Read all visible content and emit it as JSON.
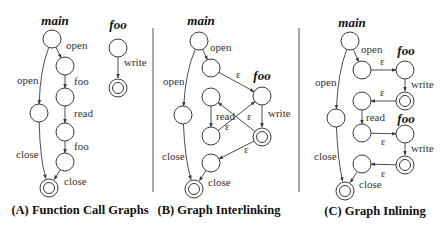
{
  "colors": {
    "stroke": "#3a3a3a",
    "text": "#333333",
    "background": "#ffffff"
  },
  "node_radius": 9,
  "dividers": [
    {
      "x": 153,
      "y1": 28,
      "y2": 192
    },
    {
      "x": 299,
      "y1": 28,
      "y2": 192
    }
  ],
  "panels": [
    {
      "id": "A",
      "caption": "(A) Function Call Graphs",
      "caption_pos": [
        80,
        214
      ],
      "graph_labels": [
        {
          "text": "main",
          "x": 55,
          "y": 25
        },
        {
          "text": "foo",
          "x": 118,
          "y": 29
        }
      ],
      "nodes": [
        {
          "id": "a0",
          "x": 52,
          "y": 39
        },
        {
          "id": "a1",
          "x": 65,
          "y": 66
        },
        {
          "id": "a2",
          "x": 65,
          "y": 97
        },
        {
          "id": "a3",
          "x": 39,
          "y": 113
        },
        {
          "id": "a4",
          "x": 65,
          "y": 132
        },
        {
          "id": "a5",
          "x": 65,
          "y": 162
        },
        {
          "id": "a6",
          "x": 49,
          "y": 188,
          "final": true
        },
        {
          "id": "f0",
          "x": 118,
          "y": 48
        },
        {
          "id": "f1",
          "x": 118,
          "y": 88,
          "final": true
        }
      ],
      "edges": [
        {
          "from": "a0",
          "to": "a1",
          "label": "open",
          "lx": 66,
          "ly": 49
        },
        {
          "from": "a1",
          "to": "a2",
          "label": "foo",
          "lx": 74,
          "ly": 85
        },
        {
          "from": "a2",
          "to": "a4",
          "label": "read",
          "lx": 74,
          "ly": 117
        },
        {
          "from": "a4",
          "to": "a5",
          "label": "foo",
          "lx": 74,
          "ly": 150
        },
        {
          "from": "a5",
          "to": "a6",
          "label": "close",
          "lx": 64,
          "ly": 185
        },
        {
          "from": "a0",
          "to": "a3",
          "label": "open",
          "lx": 17,
          "ly": 84,
          "curve": [
            40,
            70
          ]
        },
        {
          "from": "a3",
          "to": "a6",
          "label": "close",
          "lx": 16,
          "ly": 158,
          "curve": [
            40,
            160
          ]
        },
        {
          "from": "f0",
          "to": "f1",
          "label": "write",
          "lx": 124,
          "ly": 66
        }
      ]
    },
    {
      "id": "B",
      "caption": "(B) Graph Interlinking",
      "caption_pos": [
        219,
        214
      ],
      "graph_labels": [
        {
          "text": "main",
          "x": 201,
          "y": 25
        },
        {
          "text": "foo",
          "x": 262,
          "y": 80
        }
      ],
      "nodes": [
        {
          "id": "b0",
          "x": 199,
          "y": 41
        },
        {
          "id": "b1",
          "x": 211,
          "y": 68
        },
        {
          "id": "b2",
          "x": 211,
          "y": 97
        },
        {
          "id": "b3",
          "x": 183,
          "y": 115
        },
        {
          "id": "b4",
          "x": 211,
          "y": 136
        },
        {
          "id": "b5",
          "x": 211,
          "y": 163
        },
        {
          "id": "b6",
          "x": 194,
          "y": 189,
          "final": true
        },
        {
          "id": "g0",
          "x": 262,
          "y": 96
        },
        {
          "id": "g1",
          "x": 262,
          "y": 137,
          "final": true
        }
      ],
      "edges": [
        {
          "from": "b0",
          "to": "b1",
          "label": "open",
          "lx": 210,
          "ly": 51
        },
        {
          "from": "b1",
          "to": "g0",
          "label": "ε",
          "lx": 236,
          "ly": 78
        },
        {
          "from": "b2",
          "to": "b4",
          "label": "read",
          "lx": 216,
          "ly": 120
        },
        {
          "from": "b4",
          "to": "g0",
          "label": "ε",
          "lx": 225,
          "ly": 130
        },
        {
          "from": "g1",
          "to": "b2",
          "label": "ε",
          "lx": 247,
          "ly": 120
        },
        {
          "from": "g1",
          "to": "b5",
          "label": "ε",
          "lx": 244,
          "ly": 153
        },
        {
          "from": "g0",
          "to": "b6",
          "label": "",
          "skip": true
        },
        {
          "from": "b5",
          "to": "b6",
          "label": "close",
          "lx": 208,
          "ly": 186
        },
        {
          "from": "b0",
          "to": "b3",
          "label": "open",
          "lx": 163,
          "ly": 85,
          "curve": [
            186,
            70
          ]
        },
        {
          "from": "b3",
          "to": "b6",
          "label": "close",
          "lx": 162,
          "ly": 160,
          "curve": [
            185,
            160
          ]
        },
        {
          "from": "g0",
          "to": "g1",
          "label": "write",
          "lx": 268,
          "ly": 117
        }
      ]
    },
    {
      "id": "C",
      "caption": "(C) Graph Inlining",
      "caption_pos": [
        375,
        215
      ],
      "graph_labels": [
        {
          "text": "main",
          "x": 352,
          "y": 27
        },
        {
          "text": "foo",
          "x": 406,
          "y": 55
        },
        {
          "text": "foo",
          "x": 406,
          "y": 123
        }
      ],
      "nodes": [
        {
          "id": "c0",
          "x": 350,
          "y": 41
        },
        {
          "id": "c1",
          "x": 362,
          "y": 70
        },
        {
          "id": "c2",
          "x": 362,
          "y": 101
        },
        {
          "id": "c3",
          "x": 336,
          "y": 118
        },
        {
          "id": "c4",
          "x": 362,
          "y": 133
        },
        {
          "id": "c5",
          "x": 362,
          "y": 164
        },
        {
          "id": "c6",
          "x": 345,
          "y": 191,
          "final": true
        },
        {
          "id": "h0",
          "x": 405,
          "y": 70
        },
        {
          "id": "h1",
          "x": 405,
          "y": 101,
          "final": true
        },
        {
          "id": "k0",
          "x": 405,
          "y": 134
        },
        {
          "id": "k1",
          "x": 405,
          "y": 165,
          "final": true
        }
      ],
      "edges": [
        {
          "from": "c0",
          "to": "c1",
          "label": "open",
          "lx": 361,
          "ly": 53
        },
        {
          "from": "c1",
          "to": "h0",
          "label": "ε",
          "lx": 380,
          "ly": 65
        },
        {
          "from": "h0",
          "to": "h1",
          "label": "write",
          "lx": 411,
          "ly": 88
        },
        {
          "from": "h1",
          "to": "c2",
          "label": "ε",
          "lx": 380,
          "ly": 96
        },
        {
          "from": "c2",
          "to": "c4",
          "label": "read",
          "lx": 366,
          "ly": 121
        },
        {
          "from": "c4",
          "to": "k0",
          "label": "ε",
          "lx": 381,
          "ly": 145
        },
        {
          "from": "k0",
          "to": "k1",
          "label": "write",
          "lx": 411,
          "ly": 152
        },
        {
          "from": "k1",
          "to": "c5",
          "label": "ε",
          "lx": 381,
          "ly": 177
        },
        {
          "from": "c5",
          "to": "c6",
          "label": "close",
          "lx": 359,
          "ly": 188
        },
        {
          "from": "c0",
          "to": "c3",
          "label": "open",
          "lx": 315,
          "ly": 86,
          "curve": [
            338,
            72
          ]
        },
        {
          "from": "c3",
          "to": "c6",
          "label": "close",
          "lx": 314,
          "ly": 160,
          "curve": [
            338,
            162
          ]
        }
      ]
    }
  ]
}
